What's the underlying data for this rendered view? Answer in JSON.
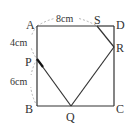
{
  "figure": {
    "type": "geometry-square-folding",
    "points": {
      "A": {
        "label": "A",
        "x": 37,
        "y": 26
      },
      "D": {
        "label": "D",
        "x": 114,
        "y": 26
      },
      "B": {
        "label": "B",
        "x": 37,
        "y": 106
      },
      "C": {
        "label": "C",
        "x": 114,
        "y": 106
      },
      "P": {
        "label": "P",
        "x": 37,
        "y": 59
      },
      "S": {
        "label": "S",
        "x": 97,
        "y": 26
      },
      "R": {
        "label": "R",
        "x": 114,
        "y": 47
      },
      "Q": {
        "label": "Q",
        "x": 71,
        "y": 106
      }
    },
    "measurements": {
      "AS": "8cm",
      "AP": "4cm",
      "PB": "6cm"
    },
    "colors": {
      "line": "#333333",
      "dashed": "#999999",
      "text": "#333333"
    }
  }
}
